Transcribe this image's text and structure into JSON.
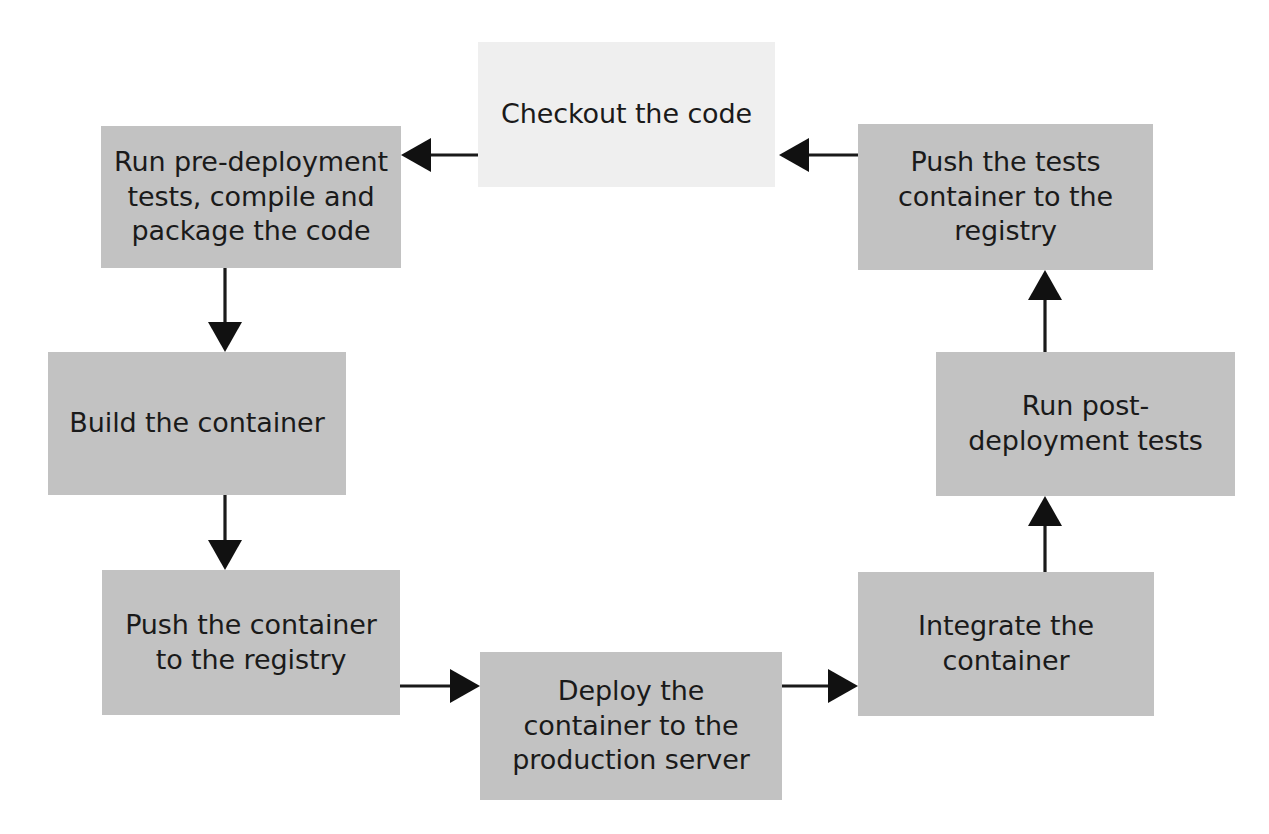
{
  "diagram": {
    "background_color": "#ffffff",
    "node_fill_gray": "#c2c2c2",
    "node_fill_light": "#efefef",
    "text_color": "#1a1a1a",
    "arrow_color": "#111111",
    "nodes": [
      {
        "id": "checkout",
        "label": "Checkout the code",
        "style": "light",
        "x": 478,
        "y": 42,
        "w": 297,
        "h": 145
      },
      {
        "id": "pre-deployment",
        "label": "Run pre-deployment\ntests, compile and\npackage the code",
        "style": "gray",
        "x": 101,
        "y": 126,
        "w": 300,
        "h": 142
      },
      {
        "id": "build-container",
        "label": "Build the container",
        "style": "gray",
        "x": 48,
        "y": 352,
        "w": 298,
        "h": 143
      },
      {
        "id": "push-container",
        "label": "Push the container\nto the registry",
        "style": "gray",
        "x": 102,
        "y": 570,
        "w": 298,
        "h": 145
      },
      {
        "id": "deploy-container",
        "label": "Deploy the\ncontainer to the\nproduction server",
        "style": "gray",
        "x": 480,
        "y": 652,
        "w": 302,
        "h": 148
      },
      {
        "id": "integrate-container",
        "label": "Integrate the\ncontainer",
        "style": "gray",
        "x": 858,
        "y": 572,
        "w": 296,
        "h": 144
      },
      {
        "id": "post-deployment",
        "label": "Run post-\ndeployment tests",
        "style": "gray",
        "x": 936,
        "y": 352,
        "w": 299,
        "h": 144
      },
      {
        "id": "push-tests",
        "label": "Push the tests\ncontainer to the\nregistry",
        "style": "gray",
        "x": 858,
        "y": 124,
        "w": 295,
        "h": 146
      }
    ],
    "edges": [
      {
        "id": "checkout-to-pre-deployment",
        "from": "checkout",
        "to": "pre-deployment",
        "direction": "left",
        "x1": 478,
        "y1": 155,
        "x2": 401,
        "y2": 155
      },
      {
        "id": "pre-deployment-to-build",
        "from": "pre-deployment",
        "to": "build-container",
        "direction": "down",
        "x1": 225,
        "y1": 268,
        "x2": 225,
        "y2": 352
      },
      {
        "id": "build-to-push-container",
        "from": "build-container",
        "to": "push-container",
        "direction": "down",
        "x1": 225,
        "y1": 495,
        "x2": 225,
        "y2": 570
      },
      {
        "id": "push-container-to-deploy",
        "from": "push-container",
        "to": "deploy-container",
        "direction": "right",
        "x1": 400,
        "y1": 686,
        "x2": 480,
        "y2": 686
      },
      {
        "id": "deploy-to-integrate",
        "from": "deploy-container",
        "to": "integrate-container",
        "direction": "right",
        "x1": 782,
        "y1": 686,
        "x2": 858,
        "y2": 686
      },
      {
        "id": "integrate-to-post-deployment",
        "from": "integrate-container",
        "to": "post-deployment",
        "direction": "up",
        "x1": 1045,
        "y1": 572,
        "x2": 1045,
        "y2": 496
      },
      {
        "id": "post-deployment-to-push-tests",
        "from": "post-deployment",
        "to": "push-tests",
        "direction": "up",
        "x1": 1045,
        "y1": 352,
        "x2": 1045,
        "y2": 270
      },
      {
        "id": "push-tests-to-checkout",
        "from": "push-tests",
        "to": "checkout",
        "direction": "left",
        "x1": 858,
        "y1": 155,
        "x2": 779,
        "y2": 155
      }
    ]
  }
}
